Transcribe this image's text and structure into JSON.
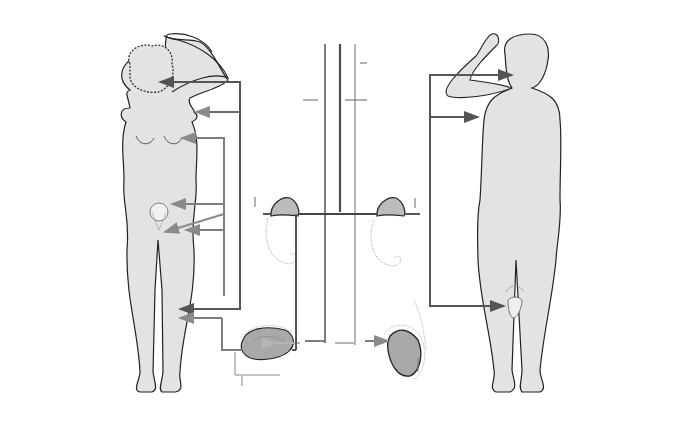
{
  "headers": {
    "female": "FEMALE",
    "male": "MALE",
    "from_brain": "From brain"
  },
  "brain": {
    "pituitary_l1": "More",
    "pituitary_l2": "pituitary",
    "pituitary_l3": "gonadotropins",
    "pituitary_l4": "secreted",
    "fsh": "FSH",
    "lh": "LH",
    "acth": "ACTH"
  },
  "adrenal": {
    "female_l1": "More",
    "female_l2": "adrenal",
    "female_l3": "androgens",
    "female_l4": "secreted",
    "male_l1": "More",
    "male_l2": "adrenal",
    "male_l3": "androgens",
    "male_l4": "secreted",
    "cortices_left_l1": "Adrenal",
    "cortices_left_l2": "cortices",
    "cortices_right_l1": "Adrenal",
    "cortices_right_l2": "cortices"
  },
  "gonads": {
    "ovaries": "Ovaries",
    "testes": "Testes",
    "progesterone_l1": "Progesterone",
    "progesterone_l2": "secreted",
    "estrogen_l1": "More",
    "estrogen_l2": "estrogen",
    "estrogen_l3": "secreted",
    "testosterone_l1": "More",
    "testosterone_l2": "testosterone",
    "testosterone_l3": "secreted"
  },
  "female_changes": [
    {
      "l1": "Armpit hair",
      "l2": "grows"
    },
    {
      "l1": "Breasts",
      "l2": "develop"
    },
    {
      "l1": "Uterus",
      "l2": "grows bigger"
    },
    {
      "l1": "Menarche",
      "l2": "(menstruation",
      "l3": "begins)"
    },
    {
      "l1": "Pubic hair",
      "l2": "grows"
    },
    {
      "l1": "Body shape",
      "l2": "rounded"
    }
  ],
  "male_changes": [
    {
      "l1": "Hair line begins",
      "l2": "to recede"
    },
    {
      "l1": "Facial hair",
      "l2": "grows"
    },
    {
      "l1": "Larynx gets",
      "l2": "bigger (voice",
      "l3": "deepens)"
    },
    {
      "l1": "Armpit hair",
      "l2": "grows"
    },
    {
      "l1": "Breasts may",
      "l2": "enlarge"
    },
    {
      "l1": "Pubic hair grows"
    },
    {
      "l1": "Penis, prostate,",
      "l2": "and seminal",
      "l3": "vesicles",
      "l4": "grow bigger"
    },
    {
      "l1": "Muscles",
      "l2": "develop"
    }
  ],
  "colors": {
    "dark_line": "#5a5a5a",
    "mid_line": "#8a8a8a",
    "light_line": "#bdbdbd",
    "body_fill": "#e3e3e3",
    "organ_fill": "#b8b8b8"
  }
}
